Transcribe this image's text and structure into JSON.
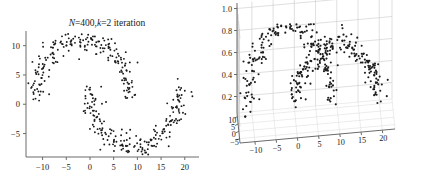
{
  "figure": {
    "background": "#ffffff",
    "point_color": "#1b1b1b",
    "axis_color": "#6b6b6b",
    "grid_color": "#c9c9c9"
  },
  "panels": [
    {
      "id": "left",
      "name": "two-moons-2d-scatter",
      "title_parts": {
        "n_symbol": "N",
        "n_eq": "=400,",
        "k_symbol": "k",
        "k_eq": "=2 iteration"
      },
      "title_plain": "N=400,k=2 iteration"
    },
    {
      "id": "right",
      "name": "two-moons-3d-scatter",
      "title_plain": ""
    }
  ],
  "chart_data": [
    {
      "type": "scatter",
      "id": "left-2d",
      "title": "N=400,k=2 iteration",
      "xlabel": "",
      "ylabel": "",
      "xlim": [
        -13.5,
        23.0
      ],
      "ylim": [
        -9.0,
        12.5
      ],
      "xticks": [
        -10,
        -5,
        0,
        5,
        10,
        15,
        20
      ],
      "xticklabels": [
        "−10",
        "−5",
        "0",
        "5",
        "10",
        "15",
        "20"
      ],
      "yticks": [
        -5,
        0,
        5,
        10
      ],
      "yticklabels": [
        "−5",
        "0",
        "5",
        "10"
      ],
      "grid": false,
      "legend": null,
      "n_points": 400,
      "clusters": 2,
      "description": "Two interleaving half-moon (two-moons) point clouds with Gaussian noise. Upper moon is an arc opening downward centred near (-1.5, 1) with radius about 10; lower moon is an arc opening upward centred near (9.5, 3) with radius about 10.",
      "series": [
        {
          "name": "moon-upper",
          "n": 200,
          "shape": "arc",
          "center": [
            -1.5,
            1.0
          ],
          "radius": 10.0,
          "angle_range_deg": [
            0,
            180
          ],
          "noise_sigma": 1.1
        },
        {
          "name": "moon-lower",
          "n": 200,
          "shape": "arc",
          "center": [
            9.5,
            3.0
          ],
          "radius": 10.0,
          "angle_range_deg": [
            180,
            360
          ],
          "noise_sigma": 1.1
        }
      ]
    },
    {
      "type": "scatter",
      "id": "right-3d",
      "projection": "3d",
      "title": "",
      "xlabel": "",
      "ylabel": "",
      "zlabel": "",
      "xlim": [
        -13.5,
        23.0
      ],
      "ylim": [
        -8.0,
        12.5
      ],
      "zlim": [
        0.05,
        1.05
      ],
      "xticks": [
        -10,
        -5,
        0,
        5,
        10,
        15,
        20
      ],
      "xticklabels": [
        "−10",
        "−5",
        "0",
        "5",
        "10",
        "15",
        "20"
      ],
      "yticks": [
        -5,
        0,
        5,
        10
      ],
      "yticklabels": [
        "−5",
        "0",
        "5",
        "10"
      ],
      "zticks": [
        0.2,
        0.4,
        0.6,
        0.8,
        1.0
      ],
      "zticklabels": [
        "0.2",
        "0.4",
        "0.6",
        "0.8",
        "1.0"
      ],
      "grid": true,
      "legend": null,
      "n_points": 400,
      "clusters": 2,
      "description": "Same 400 two-moons points lifted into 3D; the vertical axis is a membership / density value in [0.2, 1.0]. Two tent-like peaks rise over the two moon cores, reaching about 0.9 at their apexes and falling to about 0.15 at the skirts.",
      "series": [
        {
          "name": "moon-upper-membership",
          "n": 200,
          "peak_value": 0.9,
          "base_value": 0.15
        },
        {
          "name": "moon-lower-membership",
          "n": 200,
          "peak_value": 0.9,
          "base_value": 0.15
        }
      ]
    }
  ]
}
